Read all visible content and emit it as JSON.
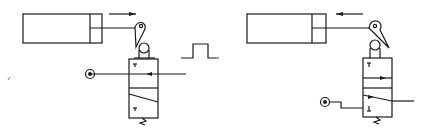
{
  "diagram": {
    "type": "pneumatic-schematic",
    "panels": [
      {
        "id": "left",
        "state": "extending",
        "cylinder_direction": "right",
        "components": [
          "double-acting-cylinder",
          "one-way-roller-lever",
          "3/2-valve",
          "air-supply",
          "pulse-signal"
        ],
        "signal": "pulse-output"
      },
      {
        "id": "right",
        "state": "retracting",
        "cylinder_direction": "left",
        "components": [
          "double-acting-cylinder",
          "one-way-roller-lever-tripped",
          "3/2-valve",
          "air-supply"
        ],
        "signal": "no-output"
      }
    ],
    "colors": {
      "line": "#1a1a1a",
      "background": "#ffffff"
    }
  }
}
